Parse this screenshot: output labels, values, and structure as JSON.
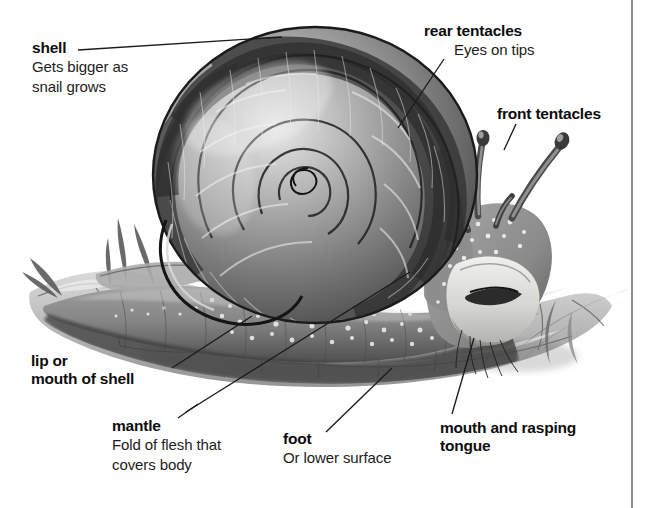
{
  "figure": {
    "subject": "snail",
    "style": "grayscale airbrush illustration with leader-line callouts",
    "background_color": "#ffffff",
    "rule_color": "#8d8d8d"
  },
  "labels": [
    {
      "key": "shell",
      "title": "shell",
      "subtitle": "Gets bigger as\nsnail grows",
      "x": 32,
      "y": 39
    },
    {
      "key": "rear_tentacles",
      "title": "rear tentacles",
      "subtitle": "Eyes on tips",
      "x": 424,
      "y": 22
    },
    {
      "key": "front_tentacles",
      "title": "front tentacles",
      "subtitle": "",
      "x": 497,
      "y": 105
    },
    {
      "key": "lip_or_mouth_of_shell",
      "title": "lip or\nmouth of shell",
      "subtitle": "",
      "x": 31,
      "y": 352
    },
    {
      "key": "mantle",
      "title": "mantle",
      "subtitle": "Fold of flesh that\ncovers body",
      "x": 112,
      "y": 417
    },
    {
      "key": "foot",
      "title": "foot",
      "subtitle": "Or lower surface",
      "x": 283,
      "y": 430
    },
    {
      "key": "mouth_and_rasping_tongue",
      "title": "mouth and rasping\ntongue",
      "subtitle": "",
      "x": 440,
      "y": 419
    }
  ],
  "label_text": {
    "shell_title": "shell",
    "shell_sub": "Gets bigger as\nsnail grows",
    "rear_title": "rear tentacles",
    "rear_sub": "Eyes on tips",
    "front_title": "front tentacles",
    "lip_title": "lip or\nmouth of shell",
    "mantle_title": "mantle",
    "mantle_sub": "Fold of flesh that\ncovers body",
    "foot_title": "foot",
    "foot_sub": "Or lower surface",
    "mouth_title": "mouth and rasping\ntongue"
  },
  "colors": {
    "ink": "#0d0d0d",
    "body_text": "#1c1c1c",
    "leader_line": "#1a1a1a",
    "shell_dark": "#3a3a3a",
    "shell_mid": "#7b7b7b",
    "shell_light": "#d9d9d9",
    "body_mid": "#8a8a8a",
    "ground_light": "#cfcfcf"
  }
}
